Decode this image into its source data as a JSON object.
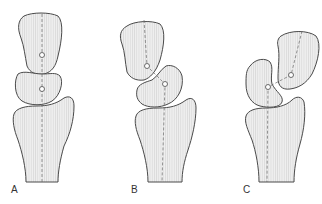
{
  "figure": {
    "panels": [
      {
        "id": "A",
        "label": "A",
        "description": "neutral alignment"
      },
      {
        "id": "B",
        "label": "B",
        "description": "middle segment displaced, top segment tilted"
      },
      {
        "id": "C",
        "label": "C",
        "description": "top segment fully displaced laterally"
      }
    ],
    "colors": {
      "bone_fill": "#ececec",
      "stripe": "#dcdcdc",
      "outline": "#4a4a4a",
      "axis": "#6a6a6a",
      "background": "#ffffff"
    }
  }
}
